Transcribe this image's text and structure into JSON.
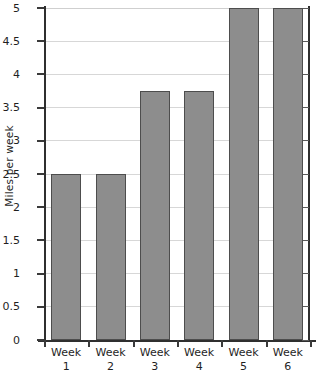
{
  "chart_data": {
    "type": "bar",
    "title": "",
    "xlabel": "",
    "ylabel": "Miles per week",
    "categories": [
      "Week 1",
      "Week 2",
      "Week 3",
      "Week 4",
      "Week 5",
      "Week 6"
    ],
    "category_lines": [
      {
        "line1": "Week",
        "line2": "1"
      },
      {
        "line1": "Week",
        "line2": "2"
      },
      {
        "line1": "Week",
        "line2": "3"
      },
      {
        "line1": "Week",
        "line2": "4"
      },
      {
        "line1": "Week",
        "line2": "5"
      },
      {
        "line1": "Week",
        "line2": "6"
      }
    ],
    "values": [
      2.5,
      2.5,
      3.75,
      3.75,
      5,
      5
    ],
    "ylim": [
      0,
      5
    ],
    "ytick_values": [
      0,
      0.5,
      1,
      1.5,
      2,
      2.5,
      3,
      3.5,
      4,
      4.5,
      5
    ],
    "ytick_labels": [
      "0",
      "0.5",
      "1",
      "1.5",
      "2",
      "2.5",
      "3",
      "3.5",
      "4",
      "4.5",
      "5"
    ],
    "grid": true,
    "legend": "none",
    "bar_color": "#8d8d8d",
    "bar_border_color": "#4d4d4d",
    "gridline_color": "#d7d7d7",
    "axis_color": "#2f2f2f",
    "background": "#ffffff"
  }
}
